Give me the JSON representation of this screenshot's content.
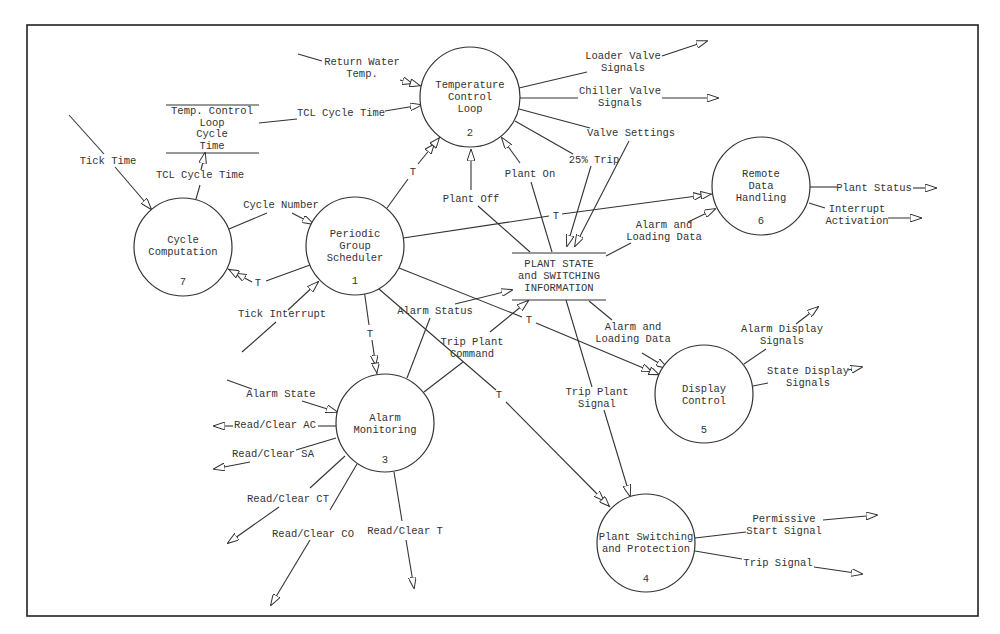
{
  "diagram": {
    "type": "data-flow-diagram",
    "processes": [
      {
        "id": "1",
        "name": [
          "Periodic",
          "Group",
          "Scheduler"
        ],
        "number": "1",
        "cx": 340,
        "cy": 246,
        "r": 49
      },
      {
        "id": "2",
        "name": [
          "Temperature",
          "Control",
          "Loop"
        ],
        "number": "2",
        "cx": 470,
        "cy": 97,
        "r": 50
      },
      {
        "id": "3",
        "name": [
          "Alarm",
          "Monitoring"
        ],
        "number": "3",
        "cx": 385,
        "cy": 423,
        "r": 49
      },
      {
        "id": "4",
        "name": [
          "Plant Switching",
          "and Protection"
        ],
        "number": "4",
        "cx": 646,
        "cy": 543,
        "r": 49
      },
      {
        "id": "5",
        "name": [
          "Display",
          "Control"
        ],
        "number": "5",
        "cx": 704,
        "cy": 394,
        "r": 49
      },
      {
        "id": "6",
        "name": [
          "Remote",
          "Data",
          "Handling"
        ],
        "number": "6",
        "cx": 761,
        "cy": 186,
        "r": 49
      },
      {
        "id": "7",
        "name": [
          "Cycle",
          "Computation"
        ],
        "number": "7",
        "cx": 183,
        "cy": 247,
        "r": 49
      }
    ],
    "stores": [
      {
        "id": "tcl-cycle-time-store",
        "name": [
          "Temp. Control",
          "Loop",
          "Cycle",
          "Time"
        ]
      },
      {
        "id": "plant-state-store",
        "name": [
          "PLANT STATE",
          "and SWITCHING",
          "INFORMATION"
        ]
      }
    ],
    "flows": [
      {
        "label": "Return Water Temp.",
        "lines": [
          "Return Water",
          "Temp."
        ],
        "to": "2"
      },
      {
        "label": "TCL Cycle Time",
        "from": "tcl-cycle-time-store",
        "to": "2"
      },
      {
        "label": "TCL Cycle Time",
        "from": "7",
        "to": "tcl-cycle-time-store"
      },
      {
        "label": "Tick Time",
        "to": "7"
      },
      {
        "label": "Cycle Number",
        "from": "7",
        "to": "1"
      },
      {
        "label": "T",
        "from": "1",
        "to": "7"
      },
      {
        "label": "Tick Interrupt",
        "to": "1"
      },
      {
        "label": "T",
        "from": "1",
        "to": "2"
      },
      {
        "label": "T",
        "from": "1",
        "to": "6"
      },
      {
        "label": "T",
        "from": "1",
        "to": "3"
      },
      {
        "label": "T",
        "from": "1",
        "to": "5"
      },
      {
        "label": "T",
        "from": "1",
        "to": "4"
      },
      {
        "label": "Loader Valve Signals",
        "lines": [
          "Loader Valve",
          "Signals"
        ],
        "from": "2"
      },
      {
        "label": "Chiller Valve Signals",
        "lines": [
          "Chiller Valve",
          "Signals"
        ],
        "from": "2"
      },
      {
        "label": "Valve Settings",
        "from": "2",
        "to": "plant-state-store"
      },
      {
        "label": "25% Trip",
        "from": "2",
        "to": "plant-state-store"
      },
      {
        "label": "Plant Off",
        "from": "plant-state-store",
        "to": "2"
      },
      {
        "label": "Plant On",
        "from": "plant-state-store",
        "to": "2"
      },
      {
        "label": "Alarm and Loading Data",
        "lines": [
          "Alarm and",
          "Loading Data"
        ],
        "from": "plant-state-store",
        "to": "6"
      },
      {
        "label": "Plant Status",
        "from": "6"
      },
      {
        "label": "Interrupt Activation",
        "lines": [
          "Interrupt",
          "Activation"
        ],
        "from": "6"
      },
      {
        "label": "Alarm Status",
        "from": "3",
        "to": "plant-state-store"
      },
      {
        "label": "Trip Plant Command",
        "lines": [
          "Trip Plant",
          "Command"
        ],
        "from": "3",
        "to": "plant-state-store"
      },
      {
        "label": "Alarm and Loading Data",
        "lines": [
          "Alarm and",
          "Loading Data"
        ],
        "from": "plant-state-store",
        "to": "5"
      },
      {
        "label": "Alarm Display Signals",
        "lines": [
          "Alarm Display",
          "Signals"
        ],
        "from": "5"
      },
      {
        "label": "State Display Signals",
        "lines": [
          "State Display",
          "Signals"
        ],
        "from": "5"
      },
      {
        "label": "Trip Plant Signal",
        "lines": [
          "Trip Plant",
          "Signal"
        ],
        "from": "plant-state-store",
        "to": "4"
      },
      {
        "label": "Permissive Start Signal",
        "lines": [
          "Permissive",
          "Start Signal"
        ],
        "from": "4"
      },
      {
        "label": "Trip Signal",
        "from": "4"
      },
      {
        "label": "Alarm State",
        "to": "3"
      },
      {
        "label": "Read/Clear AC",
        "from": "3"
      },
      {
        "label": "Read/Clear SA",
        "from": "3"
      },
      {
        "label": "Read/Clear CT",
        "from": "3"
      },
      {
        "label": "Read/Clear CO",
        "from": "3"
      },
      {
        "label": "Read/Clear T",
        "from": "3"
      }
    ]
  },
  "labels": {
    "p1": [
      "Periodic",
      "Group",
      "Scheduler",
      "1"
    ],
    "p2": [
      "Temperature",
      "Control",
      "Loop",
      "2"
    ],
    "p3": [
      "Alarm",
      "Monitoring",
      "3"
    ],
    "p4": [
      "Plant Switching",
      "and Protection",
      "4"
    ],
    "p5": [
      "Display",
      "Control",
      "5"
    ],
    "p6": [
      "Remote",
      "Data",
      "Handling",
      "6"
    ],
    "p7": [
      "Cycle",
      "Computation",
      "7"
    ],
    "store_tcl": [
      "Temp. Control",
      "Loop",
      "Cycle",
      "Time"
    ],
    "store_plant": [
      "PLANT STATE",
      "and SWITCHING",
      "INFORMATION"
    ],
    "return_water": [
      "Return Water",
      "Temp."
    ],
    "tcl_cycle_time_a": "TCL Cycle Time",
    "tcl_cycle_time_b": "TCL Cycle Time",
    "tick_time": "Tick Time",
    "cycle_number": "Cycle Number",
    "t": "T",
    "tick_interrupt": "Tick Interrupt",
    "loader_valve": [
      "Loader Valve",
      "Signals"
    ],
    "chiller_valve": [
      "Chiller Valve",
      "Signals"
    ],
    "valve_settings": "Valve Settings",
    "trip25": "25% Trip",
    "plant_off": "Plant Off",
    "plant_on": "Plant On",
    "alarm_loading_6": [
      "Alarm and",
      "Loading Data"
    ],
    "plant_status": "Plant Status",
    "interrupt_activation": [
      "Interrupt",
      "Activation"
    ],
    "alarm_status": "Alarm Status",
    "trip_plant_command": [
      "Trip Plant",
      "Command"
    ],
    "alarm_loading_5": [
      "Alarm and",
      "Loading Data"
    ],
    "alarm_display": [
      "Alarm Display",
      "Signals"
    ],
    "state_display": [
      "State Display",
      "Signals"
    ],
    "trip_plant_signal": [
      "Trip Plant",
      "Signal"
    ],
    "permissive_start": [
      "Permissive",
      "Start Signal"
    ],
    "trip_signal": "Trip Signal",
    "alarm_state": "Alarm State",
    "rc_ac": "Read/Clear AC",
    "rc_sa": "Read/Clear SA",
    "rc_ct": "Read/Clear CT",
    "rc_co": "Read/Clear CO",
    "rc_t": "Read/Clear T"
  },
  "colors": {
    "background": "#ffffff",
    "ink": "#333333"
  }
}
